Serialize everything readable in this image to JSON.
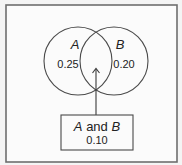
{
  "diagram": {
    "type": "venn",
    "sets": [
      {
        "name": "A",
        "probability_only": "0.25"
      },
      {
        "name": "B",
        "probability_only": "0.20"
      }
    ],
    "intersection": {
      "label_parts": [
        "A",
        " and ",
        "B"
      ],
      "probability": "0.10"
    },
    "colors": {
      "stroke": "#4a4a4a",
      "frame": "#6e6e6e",
      "background": "#fbfbfb",
      "text": "#222222"
    }
  }
}
